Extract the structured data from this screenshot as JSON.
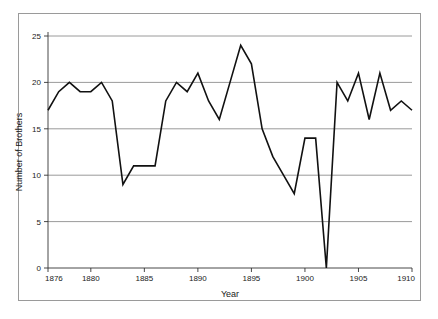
{
  "figure": {
    "frame_color": "#9a9a9a",
    "background": "#ffffff"
  },
  "chart_data": {
    "type": "line",
    "title": "",
    "subtitle": "",
    "xlabel": "Year",
    "ylabel": "Number of Brothers",
    "xlim": [
      1876,
      1910
    ],
    "ylim": [
      0,
      25
    ],
    "xticks": [
      1876,
      1880,
      1885,
      1890,
      1895,
      1900,
      1905,
      1910
    ],
    "xtick_labels": [
      "1876",
      "1880",
      "1885",
      "1890",
      "1895",
      "1900",
      "1905",
      "1910"
    ],
    "yticks": [
      0,
      5,
      10,
      15,
      20,
      25
    ],
    "ytick_labels": [
      "0",
      "5",
      "10",
      "15",
      "20",
      "25"
    ],
    "grid": "horizontal",
    "grid_color": "#808080",
    "line_color": "#111111",
    "line_width": 1.6,
    "legend": null,
    "legend_position": "none",
    "annotations": [],
    "x": [
      1876,
      1877,
      1878,
      1879,
      1880,
      1881,
      1882,
      1883,
      1884,
      1885,
      1886,
      1887,
      1888,
      1889,
      1890,
      1891,
      1892,
      1893,
      1894,
      1895,
      1896,
      1897,
      1898,
      1899,
      1900,
      1901,
      1902,
      1903,
      1904,
      1905,
      1906,
      1907,
      1908,
      1909,
      1910
    ],
    "values": [
      17,
      19,
      20,
      19,
      19,
      20,
      18,
      9,
      11,
      11,
      11,
      18,
      20,
      19,
      21,
      18,
      16,
      20,
      24,
      22,
      15,
      12,
      10,
      8,
      14,
      14,
      0,
      20,
      18,
      21,
      16,
      21,
      17,
      18,
      17
    ],
    "series": [
      {
        "name": "Number of Brothers",
        "values": [
          17,
          19,
          20,
          19,
          19,
          20,
          18,
          9,
          11,
          11,
          11,
          18,
          20,
          19,
          21,
          18,
          16,
          20,
          24,
          22,
          15,
          12,
          10,
          8,
          14,
          14,
          0,
          20,
          18,
          21,
          16,
          21,
          17,
          18,
          17
        ]
      }
    ]
  }
}
